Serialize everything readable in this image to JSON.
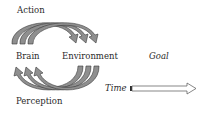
{
  "labels": {
    "action": "Action",
    "brain": "Brain",
    "environment": "Environment",
    "goal": "Goal",
    "time": "Time",
    "perception": "Perception"
  },
  "colors": {
    "arrow_fill": "#8f8f8f",
    "arrow_stroke": "#3a3a3a",
    "time_arrow_fill": "#ffffff",
    "text": "#2a2a2a"
  }
}
